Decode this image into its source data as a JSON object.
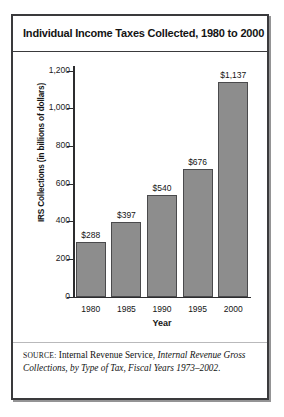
{
  "figure": {
    "title": "Individual Income Taxes Collected, 1980 to 2000",
    "source_label": "Source:",
    "source_publisher": "Internal Revenue Service,",
    "source_title": "Internal Revenue Gross Collections, by Type of Tax, Fiscal Years 1973–2002.",
    "frame_color": "#3a3a3c",
    "bar_fill": "#8d8d8d",
    "bar_outline": "#4a4a4c"
  },
  "chart_data": {
    "type": "bar",
    "title": "Individual Income Taxes Collected, 1980 to 2000",
    "xlabel": "Year",
    "ylabel": "IRS Collections (in billions of dollars)",
    "categories": [
      "1980",
      "1985",
      "1990",
      "1995",
      "2000"
    ],
    "values": [
      288,
      397,
      540,
      676,
      1137
    ],
    "data_labels": [
      "$288",
      "$397",
      "$540",
      "$676",
      "$1,137"
    ],
    "ylim": [
      0,
      1200
    ],
    "yticks": [
      0,
      200,
      400,
      600,
      800,
      1000,
      1200
    ],
    "ytick_labels": [
      "0",
      "200",
      "400",
      "600",
      "800",
      "1,000",
      "1,200"
    ],
    "grid": false,
    "legend": "none",
    "series_name": "IRS Collections"
  }
}
